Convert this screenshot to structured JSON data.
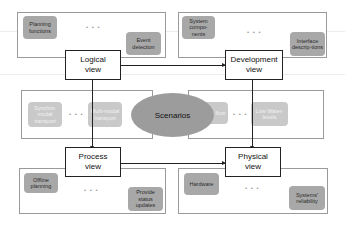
{
  "diagram": {
    "center": {
      "label": "Scenarios"
    },
    "views": {
      "logical": {
        "label": "Logical\nview"
      },
      "development": {
        "label": "Development\nview"
      },
      "process": {
        "label": "Process\nview"
      },
      "physical": {
        "label": "Physical\nview"
      }
    },
    "groups": {
      "logical": {
        "items": [
          "Planning functions",
          "Event detection"
        ],
        "ellipsis": "• • •"
      },
      "development": {
        "items": [
          "System compo-nents",
          "Interface descrip-tions"
        ],
        "ellipsis": "• • •"
      },
      "scenarios_left": {
        "items": [
          "Synchro-modal transport",
          "Multi-modal transport"
        ],
        "ellipsis": "• • •"
      },
      "scenarios_right": {
        "items": [
          "Freight flow",
          "Low Water-levels"
        ],
        "ellipsis": "• • •"
      },
      "process": {
        "items": [
          "Offline planning",
          "Provide status updates"
        ],
        "ellipsis": "• • •"
      },
      "physical": {
        "items": [
          "Hardware",
          "Systems' reliability"
        ],
        "ellipsis": "• • •"
      }
    },
    "colors": {
      "chip": "#a8a8a8",
      "chip_light": "#c9c9c9",
      "ellipse": "#9c9c9c",
      "border": "#222222"
    }
  }
}
